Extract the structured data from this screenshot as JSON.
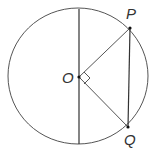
{
  "diagram": {
    "type": "circle-geometry",
    "labels": {
      "center": "O",
      "point_p": "P",
      "point_q": "Q"
    },
    "elements": [
      "circle centered at O",
      "vertical diameter through O",
      "radius OP",
      "radius OQ",
      "chord PQ (vertical)",
      "right angle marker at O between OP and OQ"
    ],
    "colors": {
      "stroke": "#444444",
      "text": "#333333",
      "background": "#ffffff"
    }
  }
}
